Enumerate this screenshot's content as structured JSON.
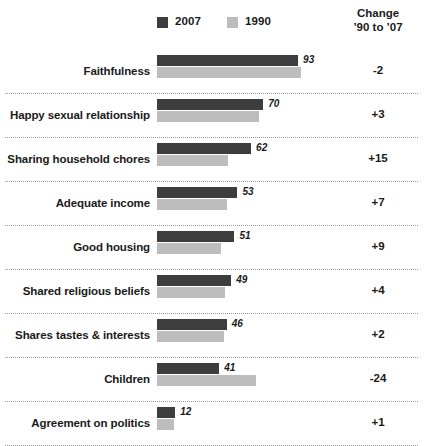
{
  "legend": {
    "items": [
      {
        "label": "2007",
        "color": "#3d3d3d",
        "swatch_name": "legend-swatch-2007"
      },
      {
        "label": "1990",
        "color": "#bdbdbd",
        "swatch_name": "legend-swatch-1990"
      }
    ]
  },
  "change_header": {
    "line1": "Change",
    "line2": "’90 to ’07"
  },
  "chart_data": {
    "type": "bar",
    "title": "",
    "xlabel": "",
    "ylabel": "",
    "orientation": "horizontal",
    "grid": false,
    "legend_position": "top",
    "xlim": [
      0,
      100
    ],
    "categories": [
      "Faithfulness",
      "Happy sexual relationship",
      "Sharing household chores",
      "Adequate income",
      "Good housing",
      "Shared religious beliefs",
      "Shares tastes & interests",
      "Children",
      "Agreement on politics"
    ],
    "series": [
      {
        "name": "2007",
        "color": "#3d3d3d",
        "values": [
          93,
          70,
          62,
          53,
          51,
          49,
          46,
          41,
          12
        ]
      },
      {
        "name": "1990",
        "color": "#bdbdbd",
        "values": [
          95,
          67,
          47,
          46,
          42,
          45,
          44,
          65,
          11
        ]
      }
    ],
    "data_labels": [
      "93",
      "70",
      "62",
      "53",
      "51",
      "49",
      "46",
      "41",
      "12"
    ],
    "annotations": {
      "column_name": "Change '90 to '07",
      "values": [
        "-2",
        "+3",
        "+15",
        "+7",
        "+9",
        "+4",
        "+2",
        "-24",
        "+1"
      ]
    }
  },
  "scale": {
    "px_per_unit": 1.517
  }
}
